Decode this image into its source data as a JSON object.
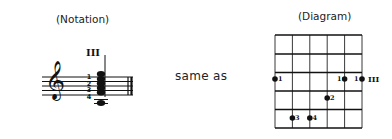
{
  "notation": {
    "title": "(Notation)",
    "position_marker": "III",
    "fingerings": [
      "1",
      "2",
      "3",
      "4"
    ]
  },
  "connector": {
    "text": "same as"
  },
  "diagram": {
    "title": "(Diagram)",
    "position_marker": "III",
    "strings": 6,
    "frets": 5,
    "dots": [
      {
        "string": 1,
        "fret": 3,
        "finger": "1"
      },
      {
        "string": 5,
        "fret": 3,
        "finger": "1"
      },
      {
        "string": 6,
        "fret": 3,
        "finger": "1"
      },
      {
        "string": 4,
        "fret": 4,
        "finger": "2"
      },
      {
        "string": 2,
        "fret": 5,
        "finger": "3"
      },
      {
        "string": 3,
        "fret": 5,
        "finger": "4"
      }
    ]
  }
}
